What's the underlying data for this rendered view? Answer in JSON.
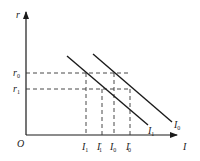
{
  "diagram": {
    "type": "IS-style investment demand shift diagram",
    "axes": {
      "y_label": "r",
      "x_label": "I",
      "origin_label": "O"
    },
    "y_ticks": [
      {
        "base": "r",
        "sub": "0",
        "label": "r0"
      },
      {
        "base": "r",
        "sub": "1",
        "label": "r1"
      }
    ],
    "x_ticks": [
      {
        "base": "I",
        "sub": "1",
        "prime": "",
        "label": "I1"
      },
      {
        "base": "I",
        "sub": "1",
        "prime": "′",
        "label": "I1'"
      },
      {
        "base": "I",
        "sub": "0",
        "prime": "",
        "label": "I0"
      },
      {
        "base": "I",
        "sub": "0",
        "prime": "′",
        "label": "I0'"
      }
    ],
    "curves": [
      {
        "name": "I0",
        "base": "I",
        "sub": "0",
        "description": "outer downward-sloping line"
      },
      {
        "name": "I1",
        "base": "I",
        "sub": "1",
        "description": "inner downward-sloping line"
      }
    ],
    "colors": {
      "line": "#1a1a1a",
      "background": "#ffffff"
    }
  }
}
